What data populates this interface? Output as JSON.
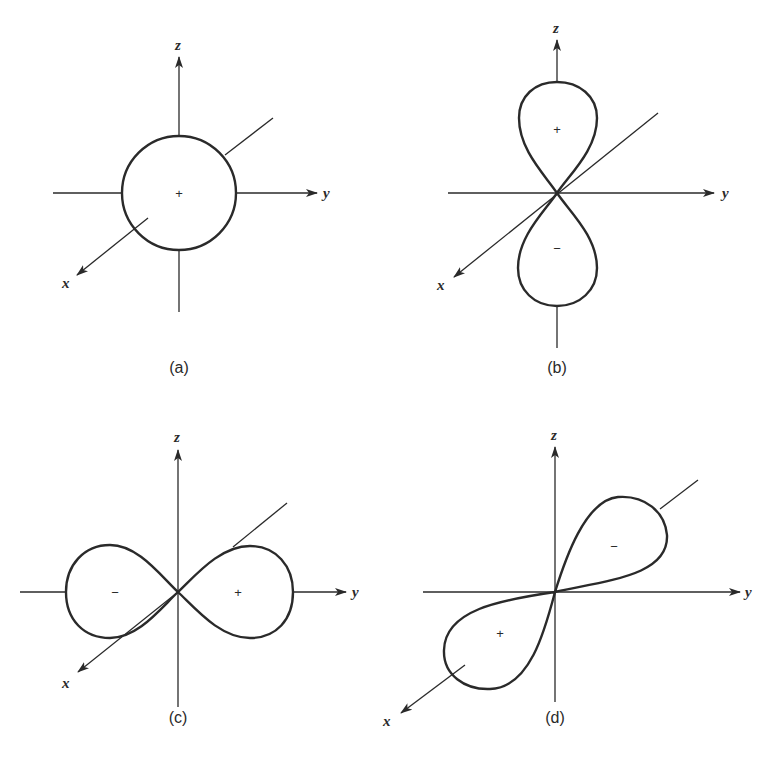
{
  "figure": {
    "panels": [
      {
        "id": "a",
        "caption": "(a)",
        "axis_labels": {
          "x": "x",
          "y": "y",
          "z": "z"
        },
        "shape": "sphere",
        "signs": [
          "+"
        ]
      },
      {
        "id": "b",
        "caption": "(b)",
        "axis_labels": {
          "x": "x",
          "y": "y",
          "z": "z"
        },
        "shape": "dumbbell along z",
        "signs": [
          "+",
          "−"
        ]
      },
      {
        "id": "c",
        "caption": "(c)",
        "axis_labels": {
          "x": "x",
          "y": "y",
          "z": "z"
        },
        "shape": "dumbbell along y",
        "signs": [
          "−",
          "+"
        ]
      },
      {
        "id": "d",
        "caption": "(d)",
        "axis_labels": {
          "x": "x",
          "y": "y",
          "z": "z"
        },
        "shape": "dumbbell along diagonal",
        "signs": [
          "−",
          "+"
        ]
      }
    ],
    "colors": {
      "ink": "#2a2a2a",
      "background": "#ffffff"
    }
  }
}
